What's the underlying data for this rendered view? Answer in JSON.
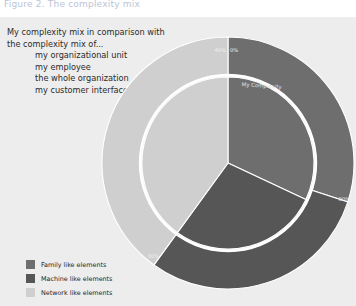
{
  "figure": {
    "title": "Figure 2. The complexity mix"
  },
  "caption": {
    "line1": "My complexity mix in comparison with",
    "line2": "the complexity mix of...",
    "items": [
      "my organizational unit",
      "my employee",
      "the whole organization",
      "my customer interface"
    ]
  },
  "legend": {
    "position": "bottom-left",
    "items": [
      {
        "label": "Family like elements",
        "color": "#6e6e6e"
      },
      {
        "label": "Machine like elements",
        "color": "#565656"
      },
      {
        "label": "Network like elements",
        "color": "#cfcfcf"
      }
    ]
  },
  "colors": {
    "panel_background": "#ededed",
    "page_background": "#ffffff",
    "family_like": "#6e6e6e",
    "machine_like": "#565656",
    "network_like": "#cfcfcf",
    "separator": "#ffffff",
    "label_text": "#e8e8e8",
    "title_text": "#b9c4d6"
  },
  "chart_data": {
    "type": "pie",
    "title": "The complexity mix",
    "xlabel": "",
    "ylabel": "",
    "grid": false,
    "legend_position": "bottom-left",
    "annotations": [
      {
        "text": "My Complexity",
        "ring": "inner",
        "angle_deg": 10
      }
    ],
    "rings": [
      {
        "name": "outer",
        "label": "Reference complexity mix",
        "categories": [
          "Family like elements",
          "Machine like elements",
          "Network like elements"
        ],
        "values": [
          30,
          30,
          40
        ],
        "value_labels": [
          "30%",
          "30%",
          "40%"
        ],
        "start_angle_deg": 0,
        "tick_labels": [
          "0%",
          "30%",
          "30%",
          "40%"
        ]
      },
      {
        "name": "inner",
        "label": "My Complexity",
        "categories": [
          "Family like elements",
          "Machine like elements",
          "Network like elements"
        ],
        "values": [
          32,
          28,
          40
        ],
        "value_labels": [
          "32%",
          "28%",
          "40%"
        ],
        "start_angle_deg": 0
      }
    ],
    "series": [
      {
        "name": "Outer ring (reference)",
        "values": [
          30,
          30,
          40
        ]
      },
      {
        "name": "Inner pie (My Complexity)",
        "values": [
          32,
          28,
          40
        ]
      }
    ],
    "categories": [
      "Family like elements",
      "Machine like elements",
      "Network like elements"
    ]
  }
}
